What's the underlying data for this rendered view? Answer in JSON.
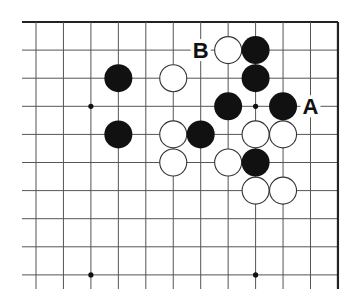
{
  "board": {
    "title": "Go problem diagram",
    "columns": 12,
    "rows_shown": 10,
    "edges": {
      "top": true,
      "right": true,
      "left": false,
      "bottom": false
    },
    "colors": {
      "line": "#555555",
      "edge": "#222222",
      "black_stone": "#111111",
      "white_stone": "#ffffff",
      "white_outline": "#333333"
    },
    "star_points": [
      [
        2,
        3
      ],
      [
        8,
        3
      ],
      [
        2,
        9
      ],
      [
        8,
        9
      ]
    ],
    "black_stones": [
      [
        3,
        2
      ],
      [
        3,
        4
      ],
      [
        8,
        1
      ],
      [
        8,
        2
      ],
      [
        7,
        3
      ],
      [
        9,
        3
      ],
      [
        6,
        4
      ],
      [
        8,
        5
      ]
    ],
    "white_stones": [
      [
        5,
        2
      ],
      [
        5,
        4
      ],
      [
        7,
        1
      ],
      [
        8,
        4
      ],
      [
        9,
        4
      ],
      [
        5,
        5
      ],
      [
        7,
        5
      ],
      [
        8,
        6
      ],
      [
        9,
        6
      ]
    ],
    "labels": [
      {
        "text": "A",
        "col": 10,
        "row": 3
      },
      {
        "text": "B",
        "col": 6,
        "row": 1
      }
    ]
  }
}
